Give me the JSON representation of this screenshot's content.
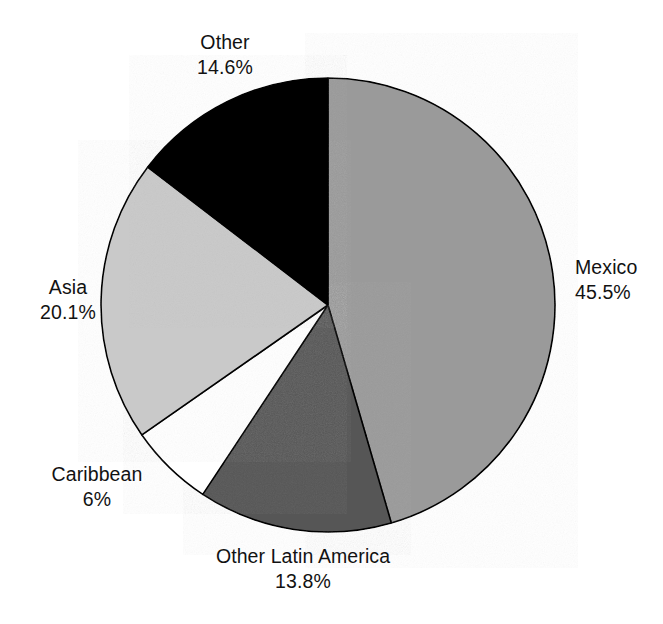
{
  "chart_data": {
    "type": "pie",
    "title": "",
    "subtitle": "",
    "xlabel": "",
    "ylabel": "",
    "legend_position": "none",
    "grid": false,
    "start_angle_deg": 0,
    "direction": "clockwise",
    "categories": [
      "Mexico",
      "Other Latin America",
      "Caribbean",
      "Asia",
      "Other"
    ],
    "values": [
      45.5,
      13.8,
      6,
      20.1,
      14.6
    ],
    "value_labels": [
      "45.5%",
      "13.8%",
      "6%",
      "20.1%",
      "14.6%"
    ],
    "colors": [
      "#9a9a9a",
      "#565656",
      "#ffffff",
      "#c9c9c9",
      "#000000"
    ],
    "slice_outline_color": "#000000",
    "slices": [
      {
        "name": "Mexico",
        "value": 45.5,
        "value_label": "45.5%",
        "color": "#9a9a9a",
        "start_deg": 0,
        "end_deg": 163.8
      },
      {
        "name": "Other Latin America",
        "value": 13.8,
        "value_label": "13.8%",
        "color": "#565656",
        "start_deg": 163.8,
        "end_deg": 213.48
      },
      {
        "name": "Caribbean",
        "value": 6,
        "value_label": "6%",
        "color": "#ffffff",
        "start_deg": 213.48,
        "end_deg": 235.08
      },
      {
        "name": "Asia",
        "value": 20.1,
        "value_label": "20.1%",
        "color": "#c9c9c9",
        "start_deg": 235.08,
        "end_deg": 307.44
      },
      {
        "name": "Other",
        "value": 14.6,
        "value_label": "14.6%",
        "color": "#000000",
        "start_deg": 307.44,
        "end_deg": 360
      }
    ]
  },
  "labels": {
    "mexico": {
      "name": "Mexico",
      "pct": "45.5%"
    },
    "olatin": {
      "name": "Other Latin America",
      "pct": "13.8%"
    },
    "caribbean": {
      "name": "Caribbean",
      "pct": "6%"
    },
    "asia": {
      "name": "Asia",
      "pct": "20.1%"
    },
    "other": {
      "name": "Other",
      "pct": "14.6%"
    }
  },
  "geometry": {
    "center_x": 328,
    "center_y": 305,
    "radius": 227
  }
}
